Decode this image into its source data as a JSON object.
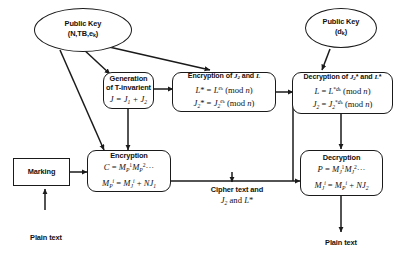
{
  "diagram": {
    "nodes": {
      "public_key_left": {
        "line1": "Public Key",
        "line2": "(N,TB,e",
        "line2_sub": "k",
        "line2_end": ")"
      },
      "public_key_right": {
        "line1": "Public Key",
        "line2": "(d",
        "line2_sub": "k",
        "line2_end": ")"
      },
      "generation": {
        "line1": "Generation",
        "line2": "of T-invarient",
        "eq1_J": "J",
        "eq1_rest": " = J",
        "eq1_sub1": "1",
        "eq1_plus": " + J",
        "eq1_sub2": "2"
      },
      "encryption_jl": {
        "title": "Encryption of J₂ and L",
        "eq1": "L* = L^e_k (mod n)",
        "eq2": "J₂* = J₂^e_k (mod n)"
      },
      "decryption_jl": {
        "title": "Decryption of J₂* and L*",
        "eq1": "L = L*^d_k (mod n)",
        "eq2": "J₂ = J₂*^d_k (mod n)"
      },
      "encryption": {
        "title": "Encryption",
        "eq1": "C = M_P^1 M_P^2 ···",
        "eq2": "M_P^i = M_J^i + N J₁"
      },
      "decryption": {
        "title": "Decryption",
        "eq1": "P = M_J^1 M_J^2 ···",
        "eq2": "M_J^i = M_P^i + N J₂"
      },
      "marking": {
        "label": "Marking"
      }
    },
    "labels": {
      "plain_text_in": "Plain text",
      "plain_text_out": "Plain text",
      "cipher_line1": "Cipher text and",
      "cipher_line2": "J₂ and L*"
    },
    "colors": {
      "stroke": "#1a1a1a",
      "background": "#ffffff",
      "text": "#111111"
    }
  }
}
